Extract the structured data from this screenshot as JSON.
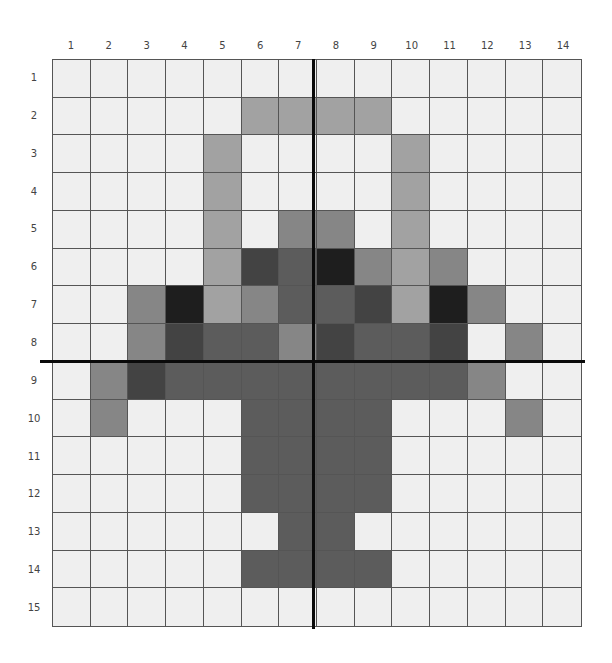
{
  "chart_data": {
    "type": "heatmap",
    "title": "",
    "columns": [
      "1",
      "2",
      "3",
      "4",
      "5",
      "6",
      "7",
      "8",
      "9",
      "10",
      "11",
      "12",
      "13",
      "14"
    ],
    "rows": [
      "1",
      "2",
      "3",
      "4",
      "5",
      "6",
      "7",
      "8",
      "9",
      "10",
      "11",
      "12",
      "13",
      "14",
      "15"
    ],
    "palette": {
      "W": "#efefef",
      "L": "#a2a2a2",
      "M": "#868686",
      "D": "#5c5c5c",
      "K": "#434343",
      "X": "#1e1e1e"
    },
    "grid": [
      "WWWWWWWWWWWWWW",
      "WWWWWLLLLWWWWW",
      "WWWWLWWWWLWWWW",
      "WWWWLWWWWLWWWW",
      "WWWWLWMMWLWWWW",
      "WWWWLKDXMLMWWW",
      "WWMXLMDDKLXMWW",
      "WWMKDDMKDDKWMW",
      "WMKDDDDDDDDMWW",
      "WMWWWDDDDWWWMW",
      "WWWWWDDDDWWWWW",
      "WWWWWDDDDWWWWW",
      "WWWWWWDDWWWWWW",
      "WWWWWDDDDWWWWW",
      "WWWWWWWWWWWWWW"
    ],
    "axes": {
      "vertical_line_between_columns": [
        7,
        8
      ],
      "horizontal_line_between_rows": [
        8,
        9
      ]
    },
    "grid_lines": true
  }
}
